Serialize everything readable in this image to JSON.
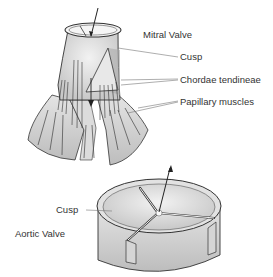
{
  "diagram": {
    "type": "anatomical-illustration",
    "mitral_valve": {
      "title": "Mitral Valve",
      "labels": {
        "cusp": "Cusp",
        "chordae": "Chordae tendineae",
        "papillary": "Papillary muscles"
      }
    },
    "aortic_valve": {
      "title": "Aortic Valve",
      "labels": {
        "cusp": "Cusp"
      }
    },
    "colors": {
      "line": "#2a2a2a",
      "fill_light": "#e6e6e6",
      "fill_mid": "#cfcfcf",
      "leader": "#777777"
    }
  }
}
